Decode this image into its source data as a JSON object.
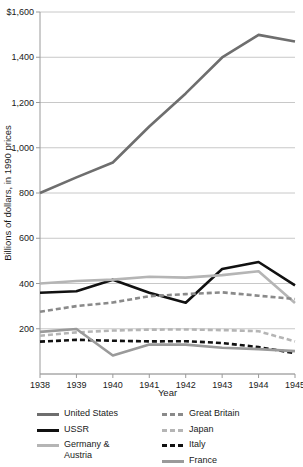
{
  "chart_data": {
    "type": "line",
    "title": "",
    "xlabel": "Year",
    "ylabel": "Billions of dollars, in 1990 prices",
    "x": [
      1938,
      1939,
      1940,
      1941,
      1942,
      1943,
      1944,
      1945
    ],
    "categories": [
      "1938",
      "1939",
      "1940",
      "1941",
      "1942",
      "1943",
      "1944",
      "1945"
    ],
    "ylim": [
      0,
      1600
    ],
    "yticks": [
      0,
      200,
      400,
      600,
      800,
      1000,
      1200,
      1400,
      1600
    ],
    "ytick_labels": [
      "",
      "200",
      "400",
      "600",
      "800",
      "1,000",
      "1,200",
      "1,400",
      "$1,600"
    ],
    "grid": "horizontal",
    "legend_position": "bottom",
    "series": [
      {
        "name": "United States",
        "color": "#6e6e6e",
        "style": "solid",
        "width": 2.6,
        "values": [
          800,
          869,
          935,
          1094,
          1240,
          1399,
          1499,
          1470
        ]
      },
      {
        "name": "USSR",
        "color": "#111111",
        "style": "solid",
        "width": 2.6,
        "values": [
          359,
          366,
          417,
          359,
          315,
          464,
          495,
          392
        ]
      },
      {
        "name": "Germany & Austria",
        "color": "#b5b5b5",
        "style": "solid",
        "width": 2.6,
        "values": [
          400,
          411,
          417,
          430,
          426,
          437,
          454,
          314
        ]
      },
      {
        "name": "Great Britain",
        "color": "#8a8a8a",
        "style": "dashed",
        "width": 2.6,
        "values": [
          275,
          300,
          316,
          344,
          353,
          361,
          346,
          331
        ]
      },
      {
        "name": "Japan",
        "color": "#b5b5b5",
        "style": "dashed",
        "width": 2.6,
        "values": [
          169,
          184,
          192,
          196,
          197,
          194,
          189,
          144
        ]
      },
      {
        "name": "Italy",
        "color": "#111111",
        "style": "dashed",
        "width": 2.6,
        "values": [
          143,
          151,
          147,
          144,
          145,
          137,
          119,
          92
        ]
      },
      {
        "name": "France",
        "color": "#9a9a9a",
        "style": "solid",
        "width": 2.6,
        "values": [
          186,
          199,
          82,
          130,
          130,
          116,
          110,
          101
        ]
      }
    ]
  },
  "legend": {
    "left_column": [
      {
        "label": "United States",
        "swatch": "line-swatch-united-states"
      },
      {
        "label": "USSR",
        "swatch": "line-swatch-ussr"
      },
      {
        "label": "Germany &\nAustria",
        "swatch": "line-swatch-germany-austria"
      }
    ],
    "right_column": [
      {
        "label": "Great Britain",
        "swatch": "line-swatch-great-britain"
      },
      {
        "label": "Japan",
        "swatch": "line-swatch-japan"
      },
      {
        "label": "Italy",
        "swatch": "line-swatch-italy"
      },
      {
        "label": "France",
        "swatch": "line-swatch-france"
      }
    ]
  },
  "colors": {
    "axis": "#9a9a9a",
    "grid": "#c8c8c8",
    "text": "#1a1a1a",
    "background": "#ffffff"
  }
}
